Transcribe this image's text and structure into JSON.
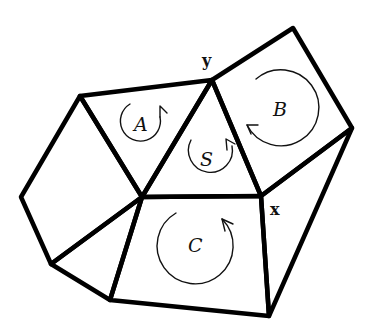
{
  "diagram": {
    "type": "planar-graph-faces-with-orientations",
    "vertex_labels": {
      "y": "y",
      "x": "x"
    },
    "faces": [
      {
        "id": "A",
        "label": "A",
        "shape": "triangle",
        "orientation": "counterclockwise-arrow"
      },
      {
        "id": "S",
        "label": "S",
        "shape": "triangle",
        "orientation": "counterclockwise-arrow"
      },
      {
        "id": "B",
        "label": "B",
        "shape": "quadrilateral",
        "orientation": "clockwise-arrow"
      },
      {
        "id": "C",
        "label": "C",
        "shape": "quadrilateral",
        "orientation": "counterclockwise-arrow"
      }
    ],
    "unlabeled_faces": [
      {
        "id": "left-pentagon",
        "shape": "quadrilateral"
      },
      {
        "id": "lower-left-triangle",
        "shape": "triangle"
      },
      {
        "id": "right-triangle",
        "shape": "triangle"
      }
    ],
    "colors": {
      "edge": "#000000",
      "arrow": "#111111",
      "background": "#ffffff"
    }
  }
}
